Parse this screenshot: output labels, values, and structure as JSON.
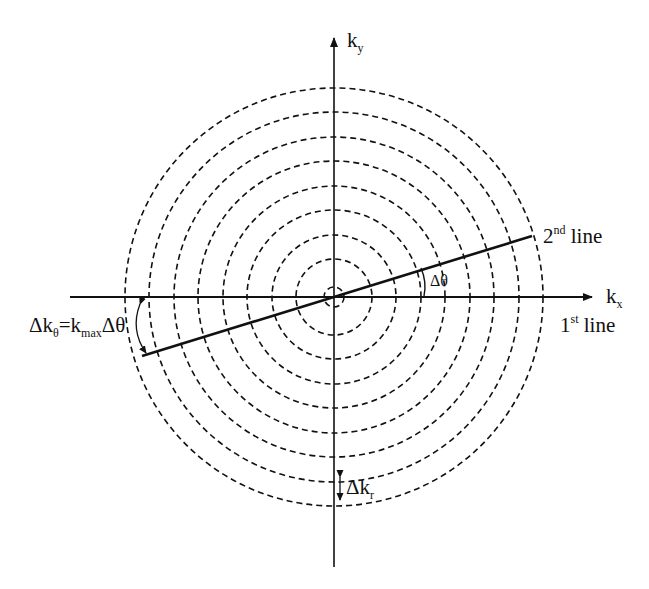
{
  "diagram": {
    "type": "k-space polar sampling",
    "center": {
      "x": 334,
      "y": 297
    },
    "circle_radii": [
      10,
      38,
      62,
      87,
      111,
      136,
      160,
      185,
      209
    ],
    "axes": {
      "kx": {
        "main": "k",
        "sub": "x"
      },
      "ky": {
        "main": "k",
        "sub": "y"
      }
    },
    "lines": {
      "first": {
        "num": "1",
        "sup": "st",
        "text": " line"
      },
      "second": {
        "num": "2",
        "sup": "nd",
        "text": " line"
      }
    },
    "annotations": {
      "delta_theta": "Δθ",
      "delta_k_theta": {
        "a": "Δk",
        "a_sub": "θ",
        "b": "=k",
        "b_sub": "max",
        "c": "Δθ"
      },
      "delta_k_r": {
        "main": "Δk",
        "sub": "r"
      }
    },
    "colors": {
      "stroke": "#111111",
      "background": "#ffffff"
    }
  }
}
